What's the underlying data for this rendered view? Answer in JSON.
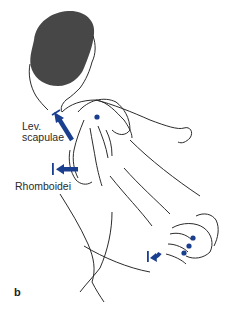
{
  "figure": {
    "panel_letter": "b",
    "labels": {
      "levator_line1": "Lev.",
      "levator_line2": "scapulae",
      "rhomboidei": "Rhomboidei"
    },
    "colors": {
      "arrow": "#1a3f8f",
      "hair": "#474747",
      "line": "#2b2b2b",
      "background": "#ffffff"
    },
    "markers": {
      "shoulder_contact_points": 1,
      "hand_contact_points": 3
    }
  }
}
